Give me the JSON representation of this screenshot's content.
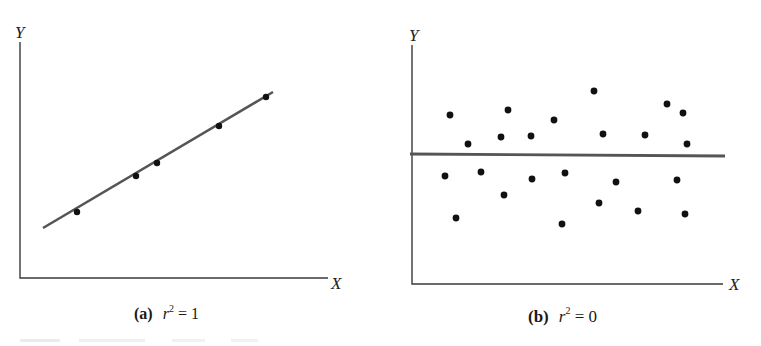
{
  "chart_data": [
    {
      "type": "scatter",
      "panel": "a",
      "caption_tag": "(a)",
      "caption_var": "r",
      "caption_exp": "2",
      "caption_rest": " = 1",
      "xlabel": "X",
      "ylabel": "Y",
      "grid": false,
      "axis_ticks": false,
      "fit_line": {
        "x1": 43,
        "y1": 228,
        "x2": 273,
        "y2": 92
      },
      "points_px": [
        [
          77,
          212
        ],
        [
          136,
          176
        ],
        [
          157,
          163
        ],
        [
          219,
          126
        ],
        [
          266,
          97
        ]
      ],
      "description": "Points lie exactly on an upward-sloping regression line (perfect fit)"
    },
    {
      "type": "scatter",
      "panel": "b",
      "caption_tag": "(b)",
      "caption_var": "r",
      "caption_exp": "2",
      "caption_rest": " = 0",
      "xlabel": "X",
      "ylabel": "Y",
      "grid": false,
      "axis_ticks": false,
      "fit_line": {
        "x1": 410,
        "y1": 154,
        "x2": 725,
        "y2": 156
      },
      "points_px": [
        [
          450,
          115
        ],
        [
          468,
          144
        ],
        [
          508,
          110
        ],
        [
          501,
          137
        ],
        [
          531,
          136
        ],
        [
          554,
          120
        ],
        [
          594,
          91
        ],
        [
          603,
          134
        ],
        [
          645,
          135
        ],
        [
          667,
          104
        ],
        [
          683,
          113
        ],
        [
          687,
          144
        ],
        [
          445,
          176
        ],
        [
          481,
          172
        ],
        [
          532,
          179
        ],
        [
          565,
          173
        ],
        [
          616,
          182
        ],
        [
          677,
          180
        ],
        [
          504,
          195
        ],
        [
          599,
          203
        ],
        [
          638,
          211
        ],
        [
          685,
          214
        ],
        [
          456,
          218
        ],
        [
          562,
          224
        ]
      ],
      "description": "Points scattered randomly around a horizontal regression line (no fit)"
    }
  ],
  "panels": {
    "a": {
      "ylabel": "Y",
      "xlabel": "X",
      "caption": {
        "tag": "(a)",
        "var": "r",
        "exp": "2",
        "rest": " = 1"
      },
      "axes": {
        "origin": [
          20,
          278
        ],
        "y_top": 42,
        "x_right": 328
      }
    },
    "b": {
      "ylabel": "Y",
      "xlabel": "X",
      "caption": {
        "tag": "(b)",
        "var": "r",
        "exp": "2",
        "rest": " = 0"
      },
      "axes": {
        "origin": [
          412,
          284
        ],
        "y_top": 45,
        "x_right": 723
      }
    }
  },
  "colors": {
    "ink": "#1a1a1a",
    "line": "#4a4a4a",
    "background": "#ffffff"
  }
}
